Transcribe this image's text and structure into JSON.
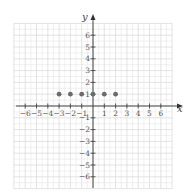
{
  "chart_data": {
    "type": "scatter",
    "title": "",
    "xlabel": "x",
    "ylabel": "y",
    "xlim": [
      -6,
      6
    ],
    "ylim": [
      -6,
      6
    ],
    "grid": true,
    "x_ticks": [
      -6,
      -5,
      -4,
      -3,
      -2,
      -1,
      1,
      2,
      3,
      4,
      5,
      6
    ],
    "y_ticks": [
      -6,
      -5,
      -4,
      -3,
      -2,
      -1,
      1,
      2,
      3,
      4,
      5,
      6
    ],
    "series": [
      {
        "name": "points",
        "points": [
          {
            "x": -3,
            "y": 1
          },
          {
            "x": -2,
            "y": 1
          },
          {
            "x": -1,
            "y": 1
          },
          {
            "x": 0,
            "y": 1
          },
          {
            "x": 1,
            "y": 1
          },
          {
            "x": 2,
            "y": 1
          }
        ],
        "color": "#6b6b6b"
      }
    ],
    "colors": {
      "grid": "#dcdcdc",
      "axis": "#333333",
      "point": "#6b6b6b"
    }
  }
}
